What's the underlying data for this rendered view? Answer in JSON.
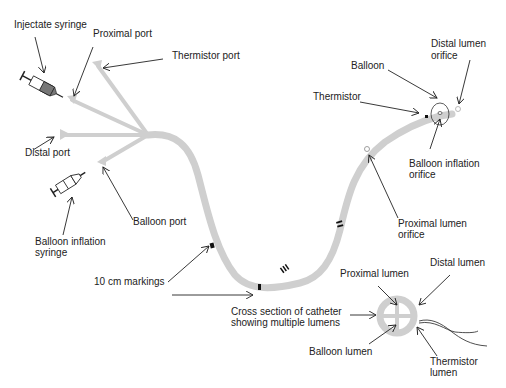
{
  "diagram": {
    "colors": {
      "catheter": "#cfcfcf",
      "text": "#222222",
      "marking": "#111111",
      "syringe_fill": "#777777"
    },
    "labels": {
      "injectate_syringe": "Injectate syringe",
      "proximal_port": "Proximal port",
      "thermistor_port": "Thermistor port",
      "distal_port": "Distal port",
      "balloon_port": "Balloon port",
      "balloon_inflation_syringe_1": "Balloon inflation",
      "balloon_inflation_syringe_2": "syringe",
      "ten_cm_markings": "10 cm markings",
      "thermistor": "Thermistor",
      "balloon": "Balloon",
      "distal_lumen_orifice_1": "Distal lumen",
      "distal_lumen_orifice_2": "orifice",
      "balloon_inflation_orifice_1": "Balloon inflation",
      "balloon_inflation_orifice_2": "orifice",
      "proximal_lumen_orifice_1": "Proximal lumen",
      "proximal_lumen_orifice_2": "orifice",
      "cross_section_1": "Cross section of catheter",
      "cross_section_2": "showing multiple lumens",
      "proximal_lumen": "Proximal lumen",
      "distal_lumen": "Distal lumen",
      "balloon_lumen": "Balloon lumen",
      "thermistor_lumen_1": "Thermistor",
      "thermistor_lumen_2": "lumen"
    }
  }
}
